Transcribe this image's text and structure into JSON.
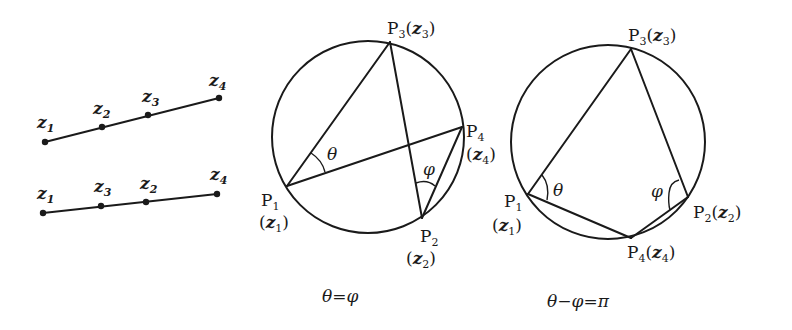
{
  "left_panel": {
    "line_top": {
      "points": [
        "z1",
        "z2",
        "z3",
        "z4"
      ],
      "labels": [
        "z",
        "z",
        "z",
        "z"
      ],
      "subs": [
        "1",
        "2",
        "3",
        "4"
      ]
    },
    "line_bottom": {
      "points": [
        "z1",
        "z3",
        "z2",
        "z4"
      ],
      "labels": [
        "z",
        "z",
        "z",
        "z"
      ],
      "subs": [
        "1",
        "3",
        "2",
        "4"
      ]
    }
  },
  "middle_panel": {
    "P3": {
      "P": "P",
      "sub": "3",
      "z": "z",
      "zsub": "3"
    },
    "P4": {
      "P": "P",
      "sub": "4",
      "z": "z",
      "zsub": "4"
    },
    "P1": {
      "P": "P",
      "sub": "1",
      "z": "z",
      "zsub": "1"
    },
    "P2": {
      "P": "P",
      "sub": "2",
      "z": "z",
      "zsub": "2"
    },
    "theta": "θ",
    "phi": "φ",
    "caption": "θ=φ"
  },
  "right_panel": {
    "P3": {
      "P": "P",
      "sub": "3",
      "z": "z",
      "zsub": "3"
    },
    "P1": {
      "P": "P",
      "sub": "1",
      "z": "z",
      "zsub": "1"
    },
    "P2": {
      "P": "P",
      "sub": "2",
      "z": "z",
      "zsub": "2"
    },
    "P4": {
      "P": "P",
      "sub": "4",
      "z": "z",
      "zsub": "4"
    },
    "theta": "θ",
    "phi": "φ",
    "caption": "θ−φ=π"
  }
}
